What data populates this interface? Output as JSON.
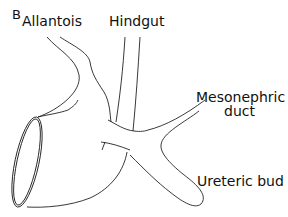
{
  "figure": {
    "panel_label": "B",
    "labels": {
      "allantois": "Allantois",
      "hindgut": "Hindgut",
      "mesonephric_line1": "Mesonephric",
      "mesonephric_line2": "duct",
      "ureteric_bud": "Ureteric bud"
    },
    "line_color": "#222222",
    "background": "#ffffff"
  }
}
